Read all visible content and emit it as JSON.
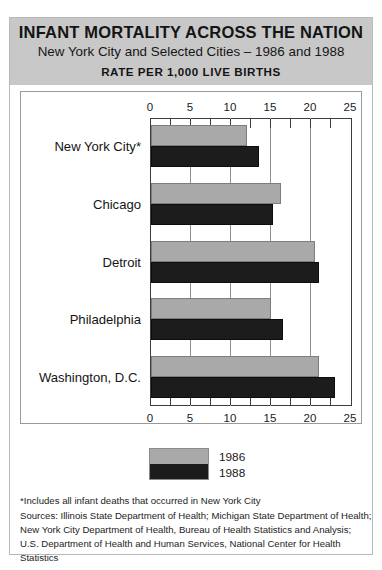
{
  "header": {
    "title": "INFANT MORTALITY ACROSS THE NATION",
    "subtitle": "New York City and Selected Cities – 1986 and 1988",
    "rate_label": "RATE PER 1,000 LIVE BIRTHS"
  },
  "legend": {
    "items": [
      {
        "label": "1986",
        "color": "#a9a9a9"
      },
      {
        "label": "1988",
        "color": "#1c1c1c"
      }
    ]
  },
  "footnote": {
    "lines": [
      "*Includes all infant deaths that occurred in New York City",
      "Sources: Illinois State Department of Health; Michigan State Department of Health;",
      "New York City Department of Health, Bureau of Health Statistics and Analysis;",
      "U.S. Department of Health and Human Services, National Center for Health",
      "Statistics"
    ]
  },
  "axis": {
    "ticks": [
      "0",
      "5",
      "10",
      "15",
      "20",
      "25"
    ]
  },
  "chart_data": {
    "type": "bar",
    "orientation": "horizontal",
    "title": "INFANT MORTALITY ACROSS THE NATION",
    "subtitle": "New York City and Selected Cities – 1986 and 1988",
    "xlabel": "RATE PER 1,000 LIVE BIRTHS",
    "ylabel": "",
    "xlim": [
      0,
      25
    ],
    "xticks": [
      0,
      5,
      10,
      15,
      20,
      25
    ],
    "minor_ticks_interval": 2.5,
    "grid": true,
    "grid_axis": "x",
    "legend_position": "bottom-left",
    "categories": [
      "New York City*",
      "Chicago",
      "Detroit",
      "Philadelphia",
      "Washington, D.C."
    ],
    "series": [
      {
        "name": "1986",
        "color": "#a9a9a9",
        "values": [
          12.0,
          16.3,
          20.5,
          15.0,
          21.0
        ]
      },
      {
        "name": "1988",
        "color": "#1c1c1c",
        "values": [
          13.5,
          15.2,
          21.0,
          16.5,
          23.0
        ]
      }
    ]
  }
}
